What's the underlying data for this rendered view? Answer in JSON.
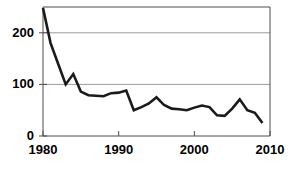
{
  "chart_data": {
    "type": "line",
    "title": "",
    "subtitle": "",
    "xlabel": "",
    "ylabel": "",
    "xlim": [
      1980,
      2010
    ],
    "ylim": [
      0,
      250
    ],
    "grid": "horizontal",
    "legend": "none",
    "y_ticks": [
      0,
      100,
      200
    ],
    "y_tick_labels": [
      "0",
      "100",
      "200"
    ],
    "x_ticks": [
      1980,
      1990,
      2000,
      2010
    ],
    "x_tick_labels": [
      "1980",
      "1990",
      "2000",
      "2010"
    ],
    "line_color": "#1a1a1a",
    "grid_color": "#9a9a9a",
    "axis_color": "#4d4d4d",
    "series": [
      {
        "name": "series-1",
        "x": [
          1980,
          1981,
          1982,
          1983,
          1984,
          1985,
          1986,
          1987,
          1988,
          1989,
          1990,
          1991,
          1992,
          1993,
          1994,
          1995,
          1996,
          1997,
          1998,
          1999,
          2000,
          2001,
          2002,
          2003,
          2004,
          2005,
          2006,
          2007,
          2008,
          2009
        ],
        "values": [
          248,
          180,
          140,
          100,
          120,
          86,
          79,
          78,
          77,
          83,
          84,
          88,
          50,
          56,
          63,
          75,
          60,
          53,
          52,
          50,
          55,
          59,
          56,
          40,
          39,
          53,
          71,
          50,
          45,
          25
        ]
      }
    ]
  }
}
